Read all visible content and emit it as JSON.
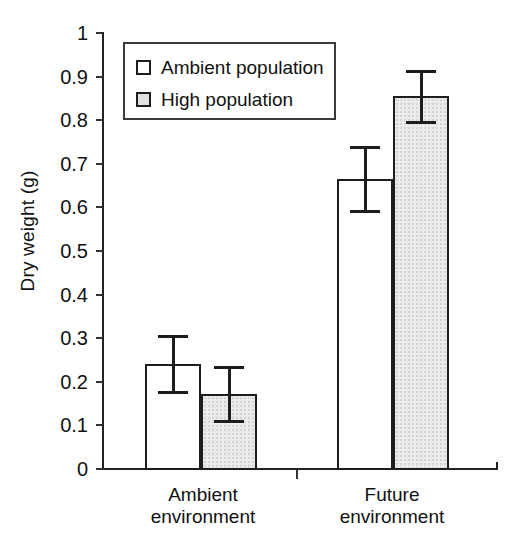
{
  "chart_data": {
    "type": "bar",
    "title": "",
    "subtitle": "",
    "xlabel": "",
    "ylabel": "Dry weight (g)",
    "categories": [
      "Ambient environment",
      "Future environment"
    ],
    "category_lines": [
      [
        "Ambient",
        "environment"
      ],
      [
        "Future",
        "environment"
      ]
    ],
    "series": [
      {
        "name": "Ambient population",
        "swatch": "white",
        "values": [
          0.241,
          0.665
        ],
        "errors": [
          0.065,
          0.073
        ]
      },
      {
        "name": "High population",
        "swatch": "gray",
        "values": [
          0.172,
          0.855
        ],
        "errors": [
          0.061,
          0.058
        ]
      }
    ],
    "ylim": [
      0,
      1
    ],
    "ytick_values": [
      0,
      0.1,
      0.2,
      0.3,
      0.4,
      0.5,
      0.6,
      0.7,
      0.8,
      0.9,
      1
    ],
    "ytick_labels": [
      "0",
      "0.1",
      "0.2",
      "0.3",
      "0.4",
      "0.5",
      "0.6",
      "0.7",
      "0.8",
      "0.9",
      "1"
    ],
    "grid": false,
    "error_bar_type": "symmetric",
    "legend": {
      "position": "top-left-inside",
      "entries": [
        {
          "label": "Ambient population",
          "swatch": "white"
        },
        {
          "label": "High population",
          "swatch": "gray"
        }
      ]
    },
    "colors": {
      "ambient_population_fill": "#ffffff",
      "high_population_fill": "#ededed",
      "bar_outline": "#1d1d1d",
      "axis": "#222222",
      "text": "#111111",
      "background": "#ffffff"
    }
  }
}
